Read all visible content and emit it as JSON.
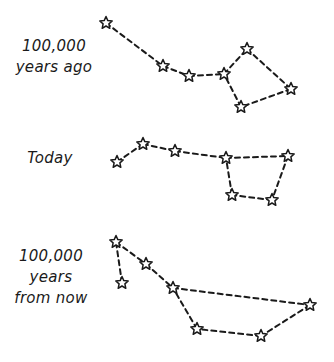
{
  "colors": {
    "ink": "#1a1a1a",
    "background": "#ffffff"
  },
  "panels": [
    {
      "label_lines": [
        "100,000",
        "years ago"
      ],
      "stars": [
        [
          106,
          23
        ],
        [
          163,
          66
        ],
        [
          189,
          76
        ],
        [
          224,
          74
        ],
        [
          247,
          49
        ],
        [
          291,
          89
        ],
        [
          241,
          107
        ]
      ],
      "links": [
        [
          0,
          1
        ],
        [
          1,
          2
        ],
        [
          2,
          3
        ],
        [
          3,
          4
        ],
        [
          4,
          5
        ],
        [
          5,
          6
        ],
        [
          6,
          3
        ]
      ]
    },
    {
      "label_lines": [
        "Today"
      ],
      "stars": [
        [
          117,
          162
        ],
        [
          143,
          144
        ],
        [
          175,
          151
        ],
        [
          226,
          158
        ],
        [
          288,
          156
        ],
        [
          232,
          195
        ],
        [
          272,
          200
        ]
      ],
      "links": [
        [
          0,
          1
        ],
        [
          1,
          2
        ],
        [
          2,
          3
        ],
        [
          3,
          4
        ],
        [
          4,
          6
        ],
        [
          6,
          5
        ],
        [
          5,
          3
        ]
      ]
    },
    {
      "label_lines": [
        "100,000",
        "years",
        "from now"
      ],
      "stars": [
        [
          116,
          242
        ],
        [
          122,
          283
        ],
        [
          146,
          264
        ],
        [
          173,
          288
        ],
        [
          197,
          329
        ],
        [
          261,
          336
        ],
        [
          310,
          305
        ]
      ],
      "links": [
        [
          1,
          0
        ],
        [
          0,
          2
        ],
        [
          2,
          3
        ],
        [
          3,
          6
        ],
        [
          6,
          5
        ],
        [
          5,
          4
        ],
        [
          4,
          3
        ]
      ]
    }
  ]
}
